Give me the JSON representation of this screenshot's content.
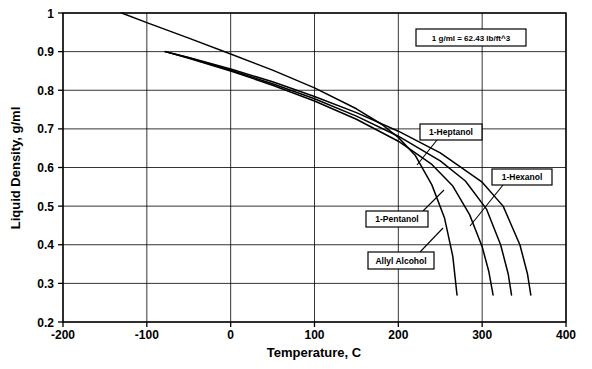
{
  "chart_data": {
    "type": "line",
    "title": "",
    "xlabel": "Temperature, C",
    "ylabel": "Liquid Density, g/ml",
    "xlim": [
      -200,
      400
    ],
    "ylim": [
      0.2,
      1
    ],
    "xticks": [
      "-200",
      "-100",
      "0",
      "100",
      "200",
      "300",
      "400"
    ],
    "xtick_values": [
      -200,
      -100,
      0,
      100,
      200,
      300,
      400
    ],
    "yticks": [
      "0.2",
      "0.3",
      "0.4",
      "0.5",
      "0.6",
      "0.7",
      "0.8",
      "0.9",
      "1"
    ],
    "ytick_values": [
      0.2,
      0.3,
      0.4,
      0.5,
      0.6,
      0.7,
      0.8,
      0.9,
      1
    ],
    "grid": true,
    "legend_position": "inline-callouts",
    "annotation": "1 g/ml = 62.43 lb/ft^3",
    "series": [
      {
        "name": "Allyl Alcohol",
        "x": [
          -130,
          -100,
          -50,
          0,
          50,
          100,
          150,
          180,
          200,
          220,
          240,
          255,
          265,
          270
        ],
        "y": [
          1.0,
          0.975,
          0.935,
          0.894,
          0.852,
          0.806,
          0.752,
          0.712,
          0.678,
          0.632,
          0.555,
          0.47,
          0.37,
          0.27
        ]
      },
      {
        "name": "1-Pentanol",
        "x": [
          -78,
          -50,
          0,
          50,
          100,
          150,
          200,
          240,
          265,
          285,
          300,
          308,
          313
        ],
        "y": [
          0.9,
          0.883,
          0.85,
          0.813,
          0.772,
          0.725,
          0.668,
          0.608,
          0.552,
          0.478,
          0.395,
          0.33,
          0.27
        ]
      },
      {
        "name": "1-Hexanol",
        "x": [
          -78,
          -50,
          0,
          50,
          100,
          150,
          200,
          250,
          280,
          305,
          322,
          331,
          335
        ],
        "y": [
          0.9,
          0.884,
          0.852,
          0.817,
          0.778,
          0.733,
          0.681,
          0.617,
          0.565,
          0.493,
          0.4,
          0.325,
          0.27
        ]
      },
      {
        "name": "1-Heptanol",
        "x": [
          -78,
          -50,
          0,
          50,
          100,
          150,
          200,
          250,
          300,
          325,
          345,
          354,
          358
        ],
        "y": [
          0.9,
          0.885,
          0.855,
          0.822,
          0.784,
          0.742,
          0.694,
          0.638,
          0.562,
          0.5,
          0.4,
          0.325,
          0.27
        ]
      }
    ],
    "callouts": [
      {
        "label": "1-Heptanol",
        "box_x": 420,
        "box_y": 124,
        "box_w": 62,
        "box_h": 16,
        "leader_x1": 437,
        "leader_y1": 140,
        "leader_x2": 417,
        "leader_y2": 165
      },
      {
        "label": "1-Hexanol",
        "box_x": 492,
        "box_y": 169,
        "box_w": 60,
        "box_h": 16,
        "leader_x1": 503,
        "leader_y1": 185,
        "leader_x2": 470,
        "leader_y2": 226
      },
      {
        "label": "1-Pentanol",
        "box_x": 366,
        "box_y": 211,
        "box_w": 62,
        "box_h": 16,
        "leader_x1": 423,
        "leader_y1": 211,
        "leader_x2": 444,
        "leader_y2": 190
      },
      {
        "label": "Allyl Alcohol",
        "box_x": 368,
        "box_y": 252,
        "box_w": 66,
        "box_h": 17,
        "leader_x1": 420,
        "leader_y1": 252,
        "leader_x2": 443,
        "leader_y2": 228
      }
    ],
    "note_box": {
      "x": 416,
      "y": 29,
      "w": 110,
      "h": 17
    }
  },
  "axes_geometry": {
    "left": 63,
    "right": 566,
    "top": 13,
    "bottom": 322
  }
}
